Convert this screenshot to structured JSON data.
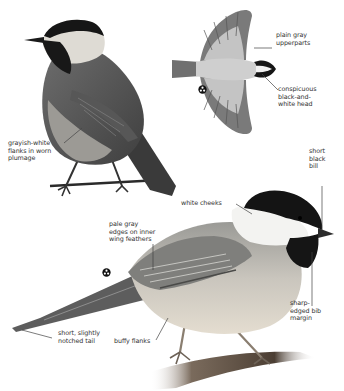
{
  "illustration": {
    "subject": "Black-capped chickadee",
    "views": [
      "perched rear view",
      "flight view from above",
      "perched side view"
    ]
  },
  "colors": {
    "background": "#ffffff",
    "cap_black": "#141414",
    "body_gray": "#8a8a8a",
    "wing_dark": "#555555",
    "cheek_white": "#f3f3f1",
    "flank_buff": "#d8cfc0",
    "label_text": "#333333",
    "leader_line": "#444444"
  },
  "labels": {
    "top_bird": {
      "flanks": "grayish-white\nflanks in worn\nplumage"
    },
    "flight_bird": {
      "upperparts": "plain gray\nupperparts",
      "head": "conspicuous\nblack-and-\nwhite head"
    },
    "main_bird": {
      "bill": "short\nblack\nbill",
      "cheeks": "white cheeks",
      "wing_edges": "pale gray\nedges on inner\nwing feathers",
      "bib": "sharp-\nedged bib\nmargin",
      "tail": "short, slightly\nnotched tail",
      "flanks": "buffy flanks"
    }
  },
  "icons": {
    "flight_symbol": "trefoil-icon",
    "main_symbol": "trefoil-icon"
  }
}
